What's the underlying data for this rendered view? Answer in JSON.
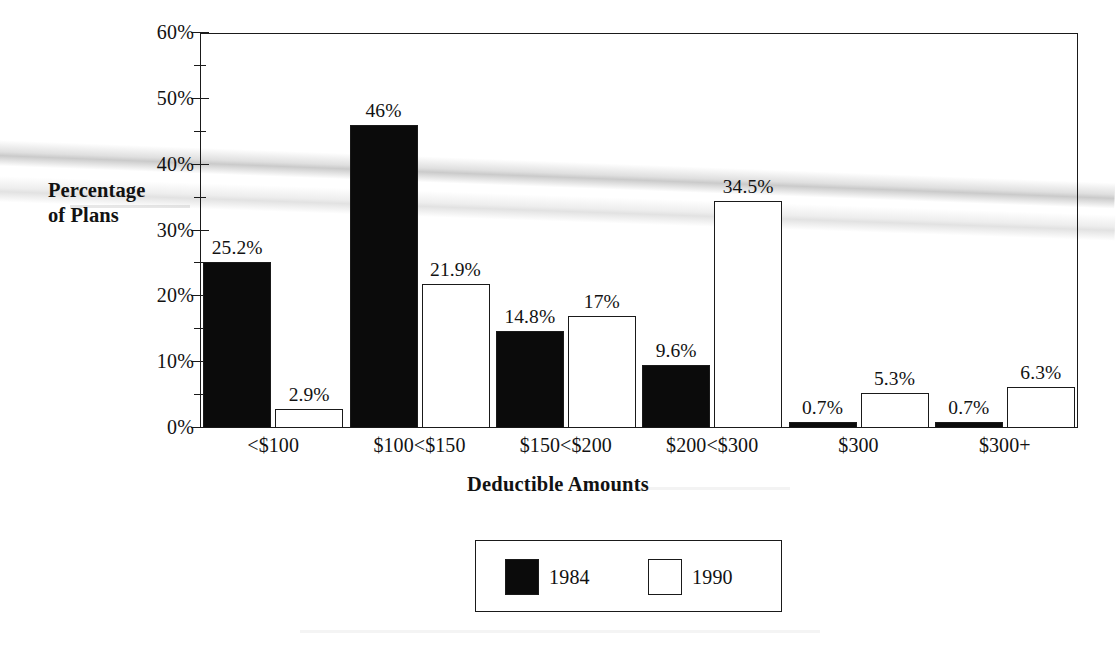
{
  "chart_data": {
    "type": "bar",
    "title": "",
    "xlabel": "Deductible Amounts",
    "ylabel": "Percentage of Plans",
    "categories": [
      "<$100",
      "$100<$150",
      "$150<$200",
      "$200<$300",
      "$300",
      "$300+"
    ],
    "series": [
      {
        "name": "1984",
        "fill": "#0b0b0b",
        "values": [
          25.2,
          46,
          14.8,
          9.6,
          0.7,
          0.7
        ],
        "labels": [
          "25.2%",
          "46%",
          "14.8%",
          "9.6%",
          "0.7%",
          "0.7%"
        ]
      },
      {
        "name": "1990",
        "fill": "#ffffff",
        "values": [
          2.9,
          21.9,
          17,
          34.5,
          5.3,
          6.3
        ],
        "labels": [
          "2.9%",
          "21.9%",
          "17%",
          "34.5%",
          "5.3%",
          "6.3%"
        ]
      }
    ],
    "ylim": [
      0,
      60
    ],
    "ytick_values": [
      0,
      10,
      20,
      30,
      40,
      50,
      60
    ],
    "ytick_labels": [
      "0%",
      "10%",
      "20%",
      "30%",
      "40%",
      "50%",
      "60%"
    ],
    "yminor_values": [
      5,
      15,
      25,
      35,
      45,
      55
    ],
    "grid": false,
    "legend_position": "bottom-center",
    "legend_entries": [
      "1984",
      "1990"
    ]
  },
  "axes": {
    "y_title": "Percentage\nof Plans",
    "y_title_line1": "Percentage",
    "y_title_line2": "of Plans",
    "x_title": "Deductible Amounts"
  },
  "colors": {
    "ink": "#1a1a1a",
    "series_1984": "#0b0b0b",
    "series_1990": "#ffffff",
    "background": "#ffffff"
  }
}
